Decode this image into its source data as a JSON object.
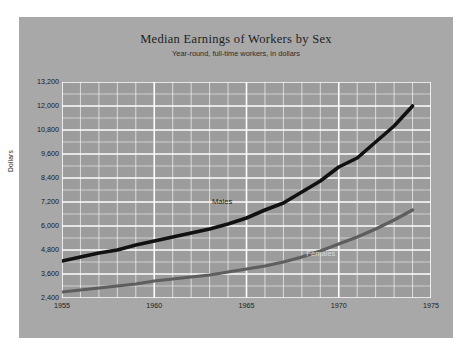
{
  "chart_data": {
    "type": "line",
    "title": "Median Earnings of Workers by Sex",
    "subtitle": "Year-round, full-time workers, in dollars",
    "xlabel": "",
    "ylabel": "Dollars",
    "xlim": [
      1955,
      1975
    ],
    "ylim": [
      2400,
      13200
    ],
    "ytick_labels": [
      "2,400",
      "3,600",
      "4,800",
      "6,000",
      "7,200",
      "8,400",
      "9,600",
      "10,800",
      "12,000",
      "13,200"
    ],
    "ytick_values": [
      2400,
      3600,
      4800,
      6000,
      7200,
      8400,
      9600,
      10800,
      12000,
      13200
    ],
    "ytick_step": 1200,
    "yminor_step": 600,
    "xtick_labels": [
      "1955",
      "1960",
      "1965",
      "1970",
      "1975"
    ],
    "xtick_values": [
      1955,
      1960,
      1965,
      1970,
      1975
    ],
    "xminor_step": 1,
    "grid": true,
    "grid_color": "#ffffff",
    "plot_background": "#9c9c9c",
    "card_background": "#a8a8a8",
    "legend_position": "inline-labels",
    "x": [
      1955,
      1956,
      1957,
      1958,
      1959,
      1960,
      1961,
      1962,
      1963,
      1964,
      1965,
      1966,
      1967,
      1968,
      1969,
      1970,
      1971,
      1972,
      1973,
      1974
    ],
    "series": [
      {
        "name": "Males",
        "color": "#111111",
        "label_x": 1964,
        "label_y": 7250,
        "values": [
          4250,
          4450,
          4650,
          4800,
          5050,
          5250,
          5450,
          5650,
          5850,
          6100,
          6400,
          6800,
          7150,
          7700,
          8250,
          8950,
          9400,
          10200,
          11000,
          12000
        ]
      },
      {
        "name": "Females",
        "color": "#5e5e5e",
        "label_x": 1969,
        "label_y": 4650,
        "values": [
          2700,
          2800,
          2900,
          3000,
          3100,
          3250,
          3350,
          3450,
          3550,
          3700,
          3850,
          4000,
          4200,
          4450,
          4750,
          5100,
          5450,
          5850,
          6300,
          6800
        ]
      }
    ]
  }
}
